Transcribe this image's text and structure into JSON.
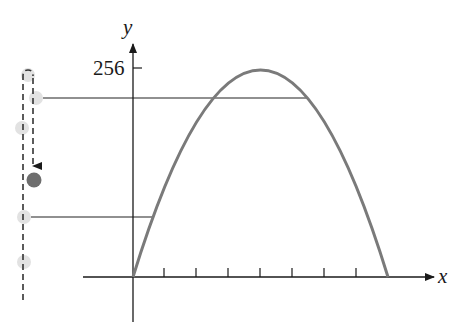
{
  "figure": {
    "type": "projectile-motion-diagram",
    "axes": {
      "x_label": "x",
      "y_label": "y",
      "y_tick_label": "256",
      "x_tick_count": 7
    },
    "curve": {
      "shape": "parabola",
      "color": "#7a7a7a",
      "peak_value_label": "256"
    },
    "ball": {
      "path": "vertical up-and-down (dashed)",
      "current_color": "#6e6e6e",
      "ghost_color": "#e2e2e2",
      "ghost_count": 5
    },
    "colors": {
      "axis": "#1a1a1a",
      "curve": "#7a7a7a",
      "guide_lines": "#222222",
      "dashed_path": "#333333"
    }
  }
}
